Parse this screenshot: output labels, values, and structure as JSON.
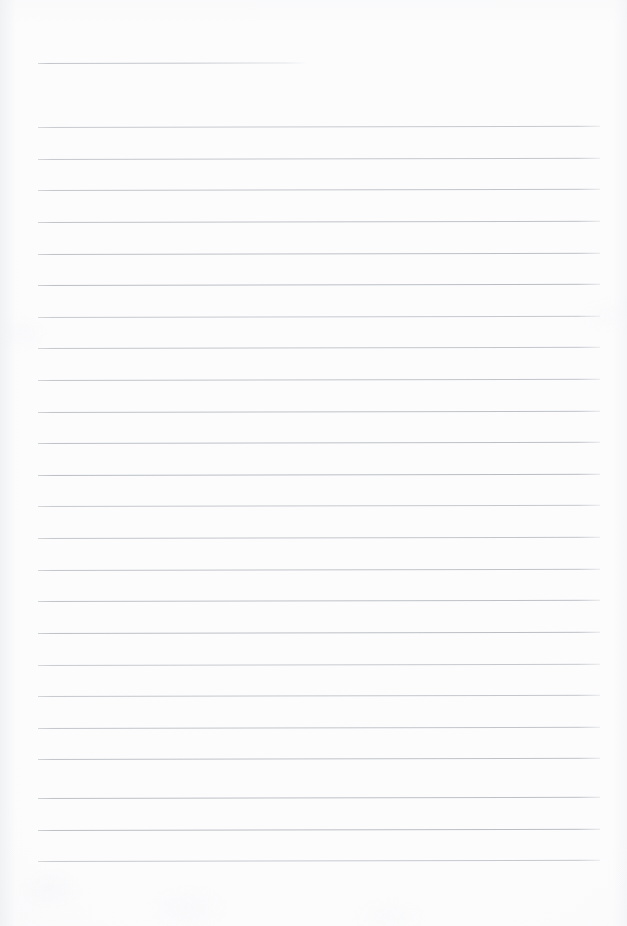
{
  "document": {
    "kind": "scanned-lined-paper",
    "title": "",
    "page_label": "",
    "text_content": "",
    "is_blank": "true"
  },
  "canvas": {
    "width": 627,
    "height": 926,
    "background_color": "#fcfcfd"
  },
  "rules": {
    "line_color": "#babec3",
    "line_thickness_px": 1,
    "left_margin_px": 38,
    "right_edge_px": 600,
    "spacing_px": 31.6,
    "tilt_deg": -0.12,
    "header_rule": {
      "name": "header-underline",
      "x_start": 38,
      "x_end": 305,
      "y": 63,
      "width": 267,
      "color": "#c0c4c9"
    },
    "body_line_count": 24,
    "first_body_line_y": 127,
    "last_body_line_y": 861,
    "body_lines": [
      {
        "y": 127,
        "x_start": 38,
        "x_end": 600
      },
      {
        "y": 159,
        "x_start": 38,
        "x_end": 600
      },
      {
        "y": 190,
        "x_start": 38,
        "x_end": 600
      },
      {
        "y": 222,
        "x_start": 38,
        "x_end": 600
      },
      {
        "y": 254,
        "x_start": 38,
        "x_end": 600
      },
      {
        "y": 285,
        "x_start": 38,
        "x_end": 600
      },
      {
        "y": 317,
        "x_start": 38,
        "x_end": 600
      },
      {
        "y": 348,
        "x_start": 38,
        "x_end": 600
      },
      {
        "y": 380,
        "x_start": 38,
        "x_end": 600
      },
      {
        "y": 412,
        "x_start": 38,
        "x_end": 600
      },
      {
        "y": 443,
        "x_start": 38,
        "x_end": 600
      },
      {
        "y": 475,
        "x_start": 38,
        "x_end": 600
      },
      {
        "y": 506,
        "x_start": 38,
        "x_end": 600
      },
      {
        "y": 538,
        "x_start": 38,
        "x_end": 600
      },
      {
        "y": 570,
        "x_start": 38,
        "x_end": 600
      },
      {
        "y": 601,
        "x_start": 38,
        "x_end": 600
      },
      {
        "y": 633,
        "x_start": 38,
        "x_end": 600
      },
      {
        "y": 665,
        "x_start": 38,
        "x_end": 600
      },
      {
        "y": 696,
        "x_start": 38,
        "x_end": 600
      },
      {
        "y": 728,
        "x_start": 38,
        "x_end": 600
      },
      {
        "y": 759,
        "x_start": 38,
        "x_end": 600
      },
      {
        "y": 798,
        "x_start": 38,
        "x_end": 600
      },
      {
        "y": 830,
        "x_start": 38,
        "x_end": 600
      },
      {
        "y": 861,
        "x_start": 38,
        "x_end": 600
      }
    ]
  },
  "footer_area": {
    "name": "blank-bottom-margin",
    "y_start": 870,
    "y_end": 926,
    "text": ""
  }
}
